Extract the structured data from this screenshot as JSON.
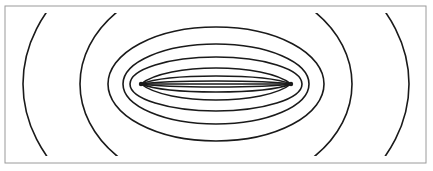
{
  "diagram": {
    "type": "confocal-field-lines",
    "frame": {
      "x": 5,
      "y": 6,
      "width": 421,
      "height": 157,
      "stroke": "#9a9a9a"
    },
    "stroke_color": "#1a1a1a",
    "foci": [
      {
        "x": 141,
        "y": 84
      },
      {
        "x": 291,
        "y": 84
      }
    ],
    "center": {
      "x": 216,
      "y": 84
    },
    "closed_ellipses": [
      {
        "rx": 108,
        "ry": 57
      },
      {
        "rx": 93,
        "ry": 40
      },
      {
        "rx": 86,
        "ry": 27
      }
    ],
    "lens_curves": [
      {
        "sag": 16
      },
      {
        "sag": 8
      },
      {
        "sag": 3
      },
      {
        "sag": 0
      }
    ],
    "clipped_ellipses": [
      {
        "rx": 193,
        "ry": 150
      },
      {
        "rx": 136,
        "ry": 105
      }
    ]
  }
}
